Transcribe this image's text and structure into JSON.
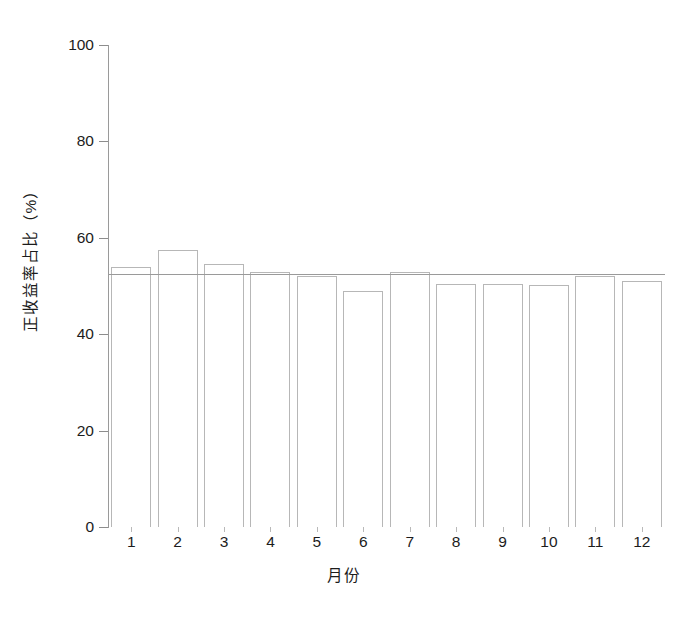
{
  "chart_data": {
    "type": "bar",
    "title": "",
    "subtitle": "",
    "xlabel": "月份",
    "ylabel": "正收益率占比（%）",
    "categories": [
      "1",
      "2",
      "3",
      "4",
      "5",
      "6",
      "7",
      "8",
      "9",
      "10",
      "11",
      "12"
    ],
    "values": [
      54.0,
      57.5,
      54.5,
      53.0,
      52.0,
      49.0,
      53.0,
      50.5,
      50.5,
      50.3,
      52.0,
      51.0
    ],
    "series": [
      {
        "name": "正收益率占比",
        "values": [
          54.0,
          57.5,
          54.5,
          53.0,
          52.0,
          49.0,
          53.0,
          50.5,
          50.5,
          50.3,
          52.0,
          51.0
        ]
      }
    ],
    "ylim": [
      0,
      100
    ],
    "ytick_labels": [
      "0",
      "20",
      "40",
      "60",
      "80",
      "100"
    ],
    "ytick_values": [
      0,
      20,
      40,
      60,
      80,
      100
    ],
    "xtick_labels": [
      "1",
      "2",
      "3",
      "4",
      "5",
      "6",
      "7",
      "8",
      "9",
      "10",
      "11",
      "12"
    ],
    "grid": false,
    "legend": "none",
    "annotations": [
      {
        "name": "average-reference-line",
        "kind": "horizontal-line",
        "value": 52.4,
        "label": ""
      }
    ],
    "bar_style": {
      "fill": "#ffffff",
      "edge": "#b7b7b7"
    },
    "axis_color": "#9a9a9a",
    "text_color": "#1c1c1c",
    "background": "#ffffff"
  }
}
